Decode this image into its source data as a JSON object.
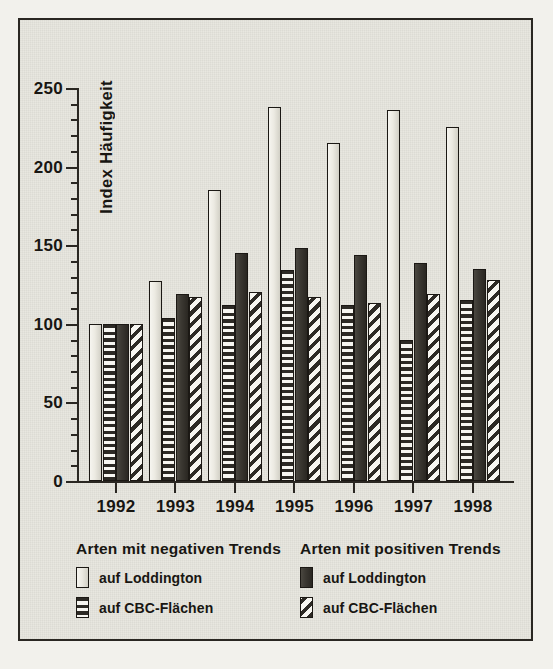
{
  "chart_data": {
    "type": "bar",
    "title": "",
    "xlabel": "",
    "ylabel": "Index Häufigkeit",
    "ylim": [
      0,
      250
    ],
    "ytick_major_step": 50,
    "ytick_minor_step": 10,
    "grid": false,
    "legend_position": "bottom",
    "categories": [
      "1992",
      "1993",
      "1994",
      "1995",
      "1996",
      "1997",
      "1998"
    ],
    "ytick_labels": [
      "0",
      "50",
      "100",
      "150",
      "200",
      "250"
    ],
    "series": [
      {
        "name": "Arten mit negativen Trends – auf Loddington",
        "group": "Arten mit negativen Trends",
        "label": "auf Loddington",
        "pattern": "light-solid",
        "values": [
          100,
          127,
          185,
          238,
          215,
          236,
          225
        ]
      },
      {
        "name": "Arten mit negativen Trends – auf CBC-Flächen",
        "group": "Arten mit negativen Trends",
        "label": "auf CBC-Flächen",
        "pattern": "horizontal-stripes",
        "values": [
          100,
          104,
          112,
          134,
          112,
          90,
          115
        ]
      },
      {
        "name": "Arten mit positiven Trends – auf Loddington",
        "group": "Arten mit positiven Trends",
        "label": "auf Loddington",
        "pattern": "dark-solid",
        "values": [
          100,
          119,
          145,
          148,
          144,
          139,
          135
        ]
      },
      {
        "name": "Arten mit positiven Trends – auf CBC-Flächen",
        "group": "Arten mit positiven Trends",
        "label": "auf CBC-Flächen",
        "pattern": "diagonal-stripes",
        "values": [
          100,
          117,
          120,
          117,
          113,
          119,
          128
        ]
      }
    ]
  },
  "legend": {
    "columns": [
      {
        "title": "Arten mit negativen Trends",
        "entries": [
          {
            "label": "auf Loddington",
            "swatch": "light-solid"
          },
          {
            "label": "auf CBC-Flächen",
            "swatch": "horizontal-stripes"
          }
        ]
      },
      {
        "title": "Arten mit positiven Trends",
        "entries": [
          {
            "label": "auf Loddington",
            "swatch": "dark-solid"
          },
          {
            "label": "auf CBC-Flächen",
            "swatch": "diagonal-stripes"
          }
        ]
      }
    ]
  },
  "colors": {
    "paper": "#e8e7e0",
    "ink": "#2a2722",
    "light_fill": "#eceae2",
    "dark_fill": "#3b3832"
  }
}
